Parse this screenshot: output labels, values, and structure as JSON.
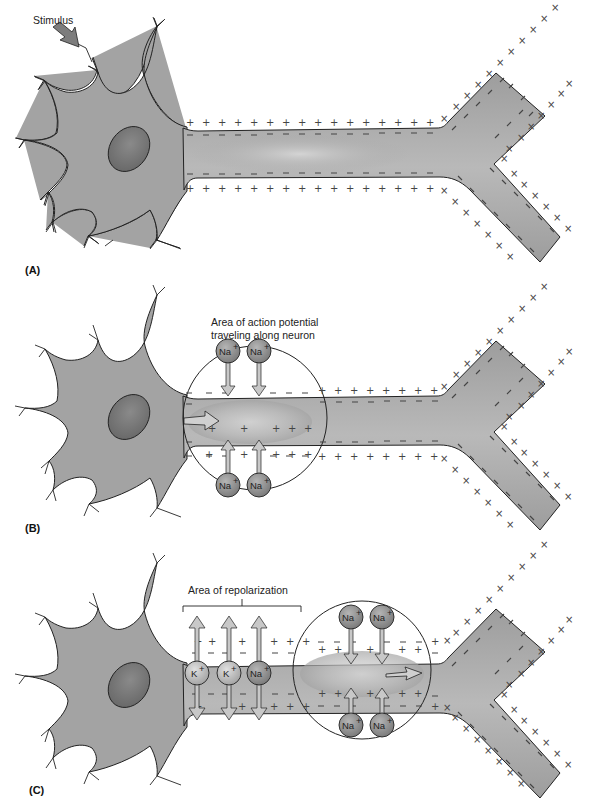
{
  "figure": {
    "colors": {
      "cell_fill": "#a3a3a3",
      "nucleus_fill": "#7a7a7a",
      "ion_fill": "#8a8a8a",
      "arrow_fill": "#c8c8c8",
      "outline": "#222222",
      "background": "#ffffff"
    },
    "symbols": {
      "positive": "+",
      "negative": "−",
      "cross": "×"
    },
    "panels": [
      {
        "id": "A",
        "label": "(A)",
        "annotations": [
          "Stimulus"
        ],
        "description": "Resting neuron: + charges outside, − charges inside the axon membrane; stimulus arrow applied at a dendrite"
      },
      {
        "id": "B",
        "label": "(B)",
        "annotations": [
          "Area of action potential",
          "traveling along neuron"
        ],
        "ions": [
          {
            "symbol": "Na",
            "charge": "+",
            "position": "top-left"
          },
          {
            "symbol": "Na",
            "charge": "+",
            "position": "top-right"
          },
          {
            "symbol": "Na",
            "charge": "+",
            "position": "bottom-left"
          },
          {
            "symbol": "Na",
            "charge": "+",
            "position": "bottom-right"
          }
        ],
        "description": "Na+ ions flow inward; membrane polarity reversed inside the circled region; arrow shows direction of propagation"
      },
      {
        "id": "C",
        "label": "(C)",
        "annotations": [
          "Area of repolarization"
        ],
        "repolarization_ions": [
          {
            "symbol": "K",
            "charge": "+"
          },
          {
            "symbol": "K",
            "charge": "+"
          },
          {
            "symbol": "Na",
            "charge": "+"
          }
        ],
        "ions": [
          {
            "symbol": "Na",
            "charge": "+",
            "position": "top-left"
          },
          {
            "symbol": "Na",
            "charge": "+",
            "position": "top-right"
          },
          {
            "symbol": "Na",
            "charge": "+",
            "position": "bottom-left"
          },
          {
            "symbol": "Na",
            "charge": "+",
            "position": "bottom-right"
          }
        ],
        "description": "Action potential has moved further along the axon; trailing region repolarizes with K+ efflux"
      }
    ]
  }
}
